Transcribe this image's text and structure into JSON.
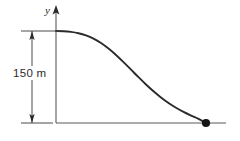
{
  "figure": {
    "background_color": "#ffffff",
    "ink_color": "#2a2a2a",
    "axis_color": "#555555",
    "dimension_color": "#4a4a4a",
    "marker_color": "#1a1a1a",
    "axis_label_y": "y",
    "dimension_label": "150 m",
    "icons": {
      "y_axis_arrow": "arrow-up-icon",
      "dimension_arrow_top": "arrow-up-icon",
      "dimension_arrow_bottom": "arrow-down-icon",
      "end_marker": "dot-marker-icon"
    }
  },
  "chart_data": {
    "type": "line",
    "title": "",
    "xlabel": "",
    "ylabel": "y",
    "grid": false,
    "legend": null,
    "annotations": [
      {
        "name": "height-dimension",
        "text": "150 m",
        "kind": "dimension",
        "orientation": "vertical",
        "from_y": 150,
        "to_y": 0
      },
      {
        "name": "end-point-marker",
        "text": "",
        "kind": "point",
        "x": 100,
        "y": 0
      }
    ],
    "axis_ranges": {
      "x": [
        0,
        112
      ],
      "y": [
        0,
        172
      ]
    },
    "series": [
      {
        "name": "trajectory",
        "x": [
          0,
          5,
          10,
          15,
          20,
          25,
          30,
          35,
          40,
          45,
          50,
          55,
          60,
          65,
          70,
          75,
          80,
          85,
          90,
          95,
          100
        ],
        "y": [
          150,
          149.7,
          148.6,
          146.4,
          142.8,
          137.5,
          130.3,
          121.3,
          110.8,
          99.2,
          87.0,
          74.7,
          62.8,
          51.7,
          41.6,
          32.6,
          24.8,
          18.0,
          12.1,
          6.6,
          0
        ]
      }
    ]
  }
}
